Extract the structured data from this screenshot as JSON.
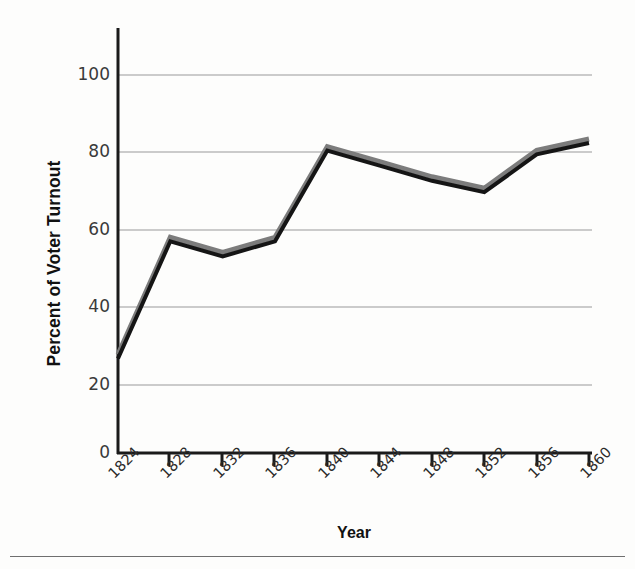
{
  "chart_data": {
    "type": "line",
    "title": "",
    "xlabel": "Year",
    "ylabel": "Percent of Voter Turnout",
    "x": [
      1824,
      1828,
      1832,
      1836,
      1840,
      1844,
      1848,
      1852,
      1856,
      1860
    ],
    "categories": [
      "1824",
      "1828",
      "1832",
      "1836",
      "1840",
      "1844",
      "1848",
      "1852",
      "1856",
      "1860"
    ],
    "values": [
      25,
      56,
      52,
      56,
      80,
      76,
      72,
      69,
      79,
      82
    ],
    "series": [
      {
        "name": "Percent of Voter Turnout",
        "values": [
          25,
          56,
          52,
          56,
          80,
          76,
          72,
          69,
          79,
          82
        ]
      }
    ],
    "xlim": [
      1824,
      1860
    ],
    "ylim": [
      0,
      108
    ],
    "y_ticks": [
      0,
      20,
      40,
      60,
      80,
      100
    ],
    "x_ticks": [
      "1824",
      "1828",
      "1832",
      "1836",
      "1840",
      "1844",
      "1848",
      "1852",
      "1856",
      "1860"
    ],
    "grid": "horizontal",
    "legend": "none",
    "line_color": "#1a1a1a",
    "shadow_color": "#7c7c7c",
    "grid_color": "#9a9a9a",
    "axis_color": "#1a1a1a"
  },
  "axes": {
    "y_title": "Percent of Voter Turnout",
    "x_title": "Year",
    "y_tick_labels": [
      "100",
      "80",
      "60",
      "40",
      "20",
      "0"
    ],
    "x_tick_labels": [
      "1824",
      "1828",
      "1832",
      "1836",
      "1840",
      "1844",
      "1848",
      "1852",
      "1856",
      "1860"
    ]
  }
}
